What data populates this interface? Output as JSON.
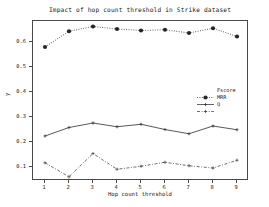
{
  "chart_data": {
    "type": "line",
    "title": "Impact of hop count threshold in Strike dataset",
    "xlabel": "Hop count threshold",
    "ylabel": "y",
    "x": [
      1,
      2,
      3,
      4,
      5,
      6,
      7,
      8,
      9
    ],
    "categories": [
      "1",
      "2",
      "3",
      "4",
      "5",
      "6",
      "7",
      "8",
      "9"
    ],
    "xlim": [
      0.5,
      9.5
    ],
    "ylim": [
      0.045,
      0.685
    ],
    "yticks": [
      0.1,
      0.2,
      0.3,
      0.4,
      0.5,
      0.6
    ],
    "ytick_labels": [
      "0.1",
      "0.2",
      "0.3",
      "0.4",
      "0.5",
      "0.6"
    ],
    "grid": false,
    "legend_position": "center-right",
    "series": [
      {
        "name": "Fscore",
        "linestyle": "dotted",
        "marker": "circle",
        "color": "#262626",
        "values": [
          0.581,
          0.644,
          0.663,
          0.653,
          0.647,
          0.65,
          0.637,
          0.656,
          0.623
        ]
      },
      {
        "name": "MRR",
        "linestyle": "solid",
        "marker": "plus",
        "color": "#3a3a3a",
        "values": [
          0.225,
          0.259,
          0.277,
          0.262,
          0.272,
          0.251,
          0.234,
          0.265,
          0.25
        ]
      },
      {
        "name": "Q",
        "linestyle": "dashdot",
        "marker": "plus",
        "color": "#4a4a4a",
        "values": [
          0.118,
          0.062,
          0.155,
          0.092,
          0.104,
          0.12,
          0.106,
          0.097,
          0.128
        ]
      }
    ]
  },
  "colors": {
    "axis": "#4a4a4a",
    "text": "#1a1a1a",
    "background": "#ffffff",
    "series_fscore": "#262626",
    "series_mrr": "#3a3a3a",
    "series_q": "#4a4a4a"
  }
}
